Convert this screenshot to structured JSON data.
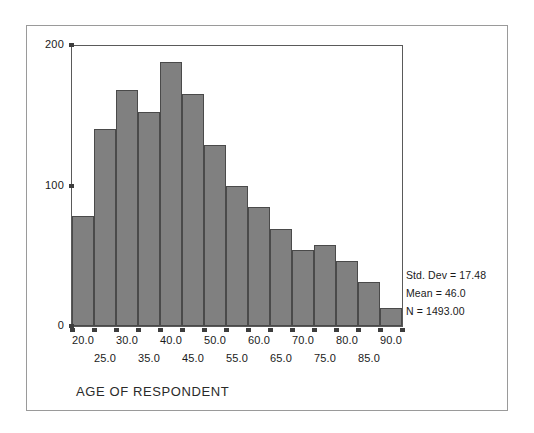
{
  "chart_data": {
    "type": "bar",
    "title": "",
    "xlabel": "AGE OF RESPONDENT",
    "ylabel": "",
    "ylim": [
      0,
      200
    ],
    "xlim": [
      17.5,
      92.5
    ],
    "grid": false,
    "legend": "none",
    "bin_width": 5,
    "categories": [
      "20.0",
      "25.0",
      "30.0",
      "35.0",
      "40.0",
      "45.0",
      "50.0",
      "55.0",
      "60.0",
      "65.0",
      "70.0",
      "75.0",
      "80.0",
      "85.0",
      "90.0"
    ],
    "bin_centers": [
      20,
      25,
      30,
      35,
      40,
      45,
      50,
      55,
      60,
      65,
      70,
      75,
      80,
      85,
      90
    ],
    "values": [
      78,
      140,
      168,
      152,
      188,
      165,
      129,
      100,
      85,
      69,
      54,
      58,
      46,
      31,
      13
    ],
    "y_ticks": [
      "0",
      "100",
      "200"
    ],
    "y_tick_values": [
      0,
      100,
      200
    ],
    "x_ticks_row_top": [
      "20.0",
      "30.0",
      "40.0",
      "50.0",
      "60.0",
      "70.0",
      "80.0",
      "90.0"
    ],
    "x_ticks_row_bottom": [
      "25.0",
      "35.0",
      "45.0",
      "55.0",
      "65.0",
      "75.0",
      "85.0"
    ],
    "annotations": [
      "Std. Dev = 17.48",
      "Mean = 46.0",
      "N = 1493.00"
    ],
    "bar_color": "#808080",
    "bar_edge_color": "#4a4a4a",
    "axis_color": "#5a5a5a"
  },
  "figure": {
    "axis_title": "AGE OF RESPONDENT",
    "stats": {
      "std_dev": "Std. Dev = 17.48",
      "mean": "Mean = 46.0",
      "n": "N = 1493.00"
    }
  }
}
